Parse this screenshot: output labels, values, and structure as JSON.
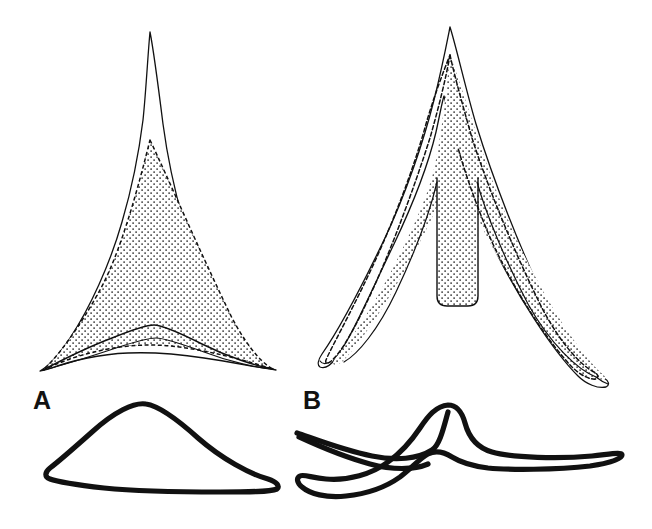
{
  "figure": {
    "kind": "scientific-line-drawing",
    "background_color": "#ffffff",
    "ink_color": "#111111",
    "stipple_color": "#2b2b2b",
    "width": 652,
    "height": 529
  },
  "panels": [
    {
      "id": "A",
      "label": "A",
      "label_position": {
        "x": 33,
        "y": 388
      },
      "plan_view": {
        "name": "triangular-deltoid-element",
        "outline_style": "thin-solid",
        "inner_field_style": "dashed-outline-stippled-fill",
        "apex": {
          "x": 150,
          "y": 32
        },
        "left_tip": {
          "x": 40,
          "y": 371
        },
        "right_tip": {
          "x": 276,
          "y": 370
        },
        "has_basal_ridge": true,
        "has_central_notch": false
      },
      "profile_view": {
        "name": "lateral-profile-outline",
        "outline_style": "thick-solid",
        "shape": "low-arched-hump",
        "apex": {
          "x": 146,
          "y": 404
        },
        "left_tip": {
          "x": 47,
          "y": 477
        },
        "right_tip": {
          "x": 277,
          "y": 489
        }
      }
    },
    {
      "id": "B",
      "label": "B",
      "label_position": {
        "x": 303,
        "y": 388
      },
      "plan_view": {
        "name": "bifurcate-v-shaped-element",
        "outline_style": "thin-solid",
        "inner_field_style": "dashed-outline-stippled-fill",
        "apex": {
          "x": 450,
          "y": 27
        },
        "left_tip": {
          "x": 333,
          "y": 363
        },
        "right_tip": {
          "x": 606,
          "y": 379
        },
        "has_basal_ridge": false,
        "has_central_notch": true,
        "central_stem": {
          "top_y": 177,
          "bottom_y": 306,
          "left_x": 437,
          "right_x": 477
        }
      },
      "profile_view": {
        "name": "lateral-profile-outline",
        "outline_style": "thick-solid",
        "shape": "sinuous-wave-with-central-peak",
        "peak": {
          "x": 448,
          "y": 405
        },
        "left_tip": {
          "x": 297,
          "y": 437
        },
        "right_tip": {
          "x": 620,
          "y": 455
        }
      }
    }
  ]
}
